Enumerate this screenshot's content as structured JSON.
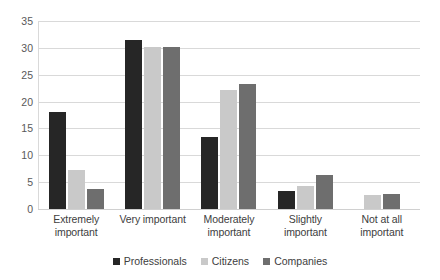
{
  "chart_data": {
    "type": "bar",
    "title": "",
    "subtitle": "",
    "xlabel": "",
    "ylabel": "",
    "ylim": [
      0,
      35
    ],
    "ytick_step": 5,
    "yticks": [
      35,
      30,
      25,
      20,
      15,
      10,
      5,
      0
    ],
    "grid": "horizontal",
    "legend_position": "bottom-center",
    "categories": [
      "Extremely important",
      "Very important",
      "Moderately important",
      "Slightly important",
      "Not at all important"
    ],
    "category_lines": [
      [
        "Extremely",
        "important"
      ],
      [
        "Very important"
      ],
      [
        "Moderately",
        "important"
      ],
      [
        "Slightly important"
      ],
      [
        "Not at all",
        "important"
      ]
    ],
    "series": [
      {
        "name": "Professionals",
        "color": "#262626",
        "values": [
          18.0,
          31.4,
          13.4,
          3.3,
          0
        ]
      },
      {
        "name": "Citizens",
        "color": "#c9c9c9",
        "values": [
          7.2,
          30.1,
          22.1,
          4.3,
          2.7
        ]
      },
      {
        "name": "Companies",
        "color": "#6e6e6e",
        "values": [
          3.7,
          30.1,
          23.3,
          6.3,
          2.8
        ]
      }
    ]
  },
  "colors": {
    "professionals": "#262626",
    "citizens": "#c9c9c9",
    "companies": "#6e6e6e",
    "gridline": "#d9d9d9",
    "tick_text": "#595959",
    "label_text": "#404040",
    "background": "#ffffff"
  }
}
